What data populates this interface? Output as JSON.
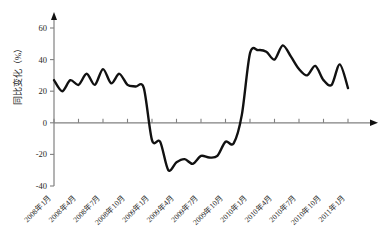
{
  "chart_data": {
    "type": "line",
    "title": "",
    "xlabel": "",
    "ylabel": "同比变化（%）",
    "ylim": [
      -40,
      60
    ],
    "yticks": [
      -40,
      -20,
      0,
      20,
      40,
      60
    ],
    "ytick_labels": [
      "-40",
      "-20",
      "0",
      "20",
      "40",
      "60"
    ],
    "grid": false,
    "legend": "none",
    "line_color": "#111111",
    "axis_color": "#808080",
    "xtick_labels": [
      "2008年1月",
      "2008年4月",
      "2008年7月",
      "2008年10月",
      "2009年1月",
      "2009年4月",
      "2009年7月",
      "2009年10月",
      "2010年1月",
      "2010年4月",
      "2010年7月",
      "2010年10月",
      "2011年1月"
    ],
    "x": [
      "2008-01",
      "2008-02",
      "2008-03",
      "2008-04",
      "2008-05",
      "2008-06",
      "2008-07",
      "2008-08",
      "2008-09",
      "2008-10",
      "2008-11",
      "2008-12",
      "2009-01",
      "2009-02",
      "2009-03",
      "2009-04",
      "2009-05",
      "2009-06",
      "2009-07",
      "2009-08",
      "2009-09",
      "2009-10",
      "2009-11",
      "2009-12",
      "2010-01",
      "2010-02",
      "2010-03",
      "2010-04",
      "2010-05",
      "2010-06",
      "2010-07",
      "2010-08",
      "2010-09",
      "2010-10",
      "2010-11",
      "2010-12",
      "2011-01"
    ],
    "values": [
      27,
      20,
      27,
      24,
      31,
      24,
      34,
      25,
      31,
      24,
      23,
      22,
      -11,
      -12,
      -30,
      -25,
      -23,
      -26,
      -21,
      -22,
      -21,
      -12,
      -13,
      5,
      44,
      46,
      45,
      40,
      49,
      42,
      34,
      30,
      36,
      27,
      24,
      37,
      22
    ],
    "xlim_index": [
      0,
      36
    ]
  }
}
